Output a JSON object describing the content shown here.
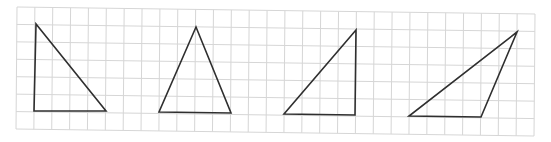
{
  "diagram": {
    "type": "grid-with-triangles",
    "background": "#ffffff",
    "grid": {
      "line_color": "#d6d6d6",
      "columns": 29,
      "rows": 7,
      "corners": {
        "top_left": [
          17,
          7
        ],
        "top_right": [
          535,
          14
        ],
        "bottom_left": [
          16,
          129
        ],
        "bottom_right": [
          534,
          136
        ]
      }
    },
    "shape_stroke": "#2f2f2f",
    "triangles": [
      {
        "name": "right-triangle-left",
        "points": [
          [
            36,
            24
          ],
          [
            34,
            111
          ],
          [
            106,
            111
          ]
        ]
      },
      {
        "name": "isosceles-triangle",
        "points": [
          [
            196,
            27
          ],
          [
            159,
            112
          ],
          [
            231,
            113
          ]
        ]
      },
      {
        "name": "right-triangle-right",
        "points": [
          [
            356,
            30
          ],
          [
            284,
            114
          ],
          [
            355,
            115
          ]
        ]
      },
      {
        "name": "obtuse-triangle",
        "points": [
          [
            517,
            32
          ],
          [
            409,
            116
          ],
          [
            481,
            117
          ]
        ]
      }
    ]
  }
}
